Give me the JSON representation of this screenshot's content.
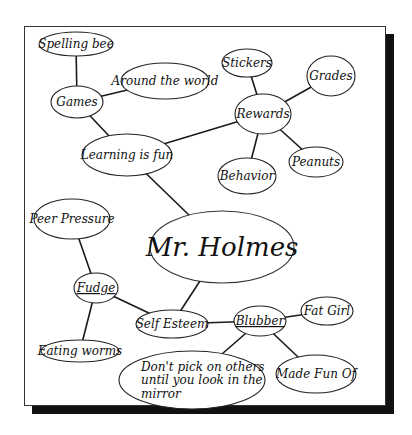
{
  "diagram": {
    "type": "concept-map",
    "center": {
      "id": "mr-holmes",
      "label": "Mr. Holmes"
    },
    "nodes": [
      {
        "id": "spelling-bee",
        "label": "Spelling bee",
        "cx": 76,
        "cy": 44,
        "rx": 37,
        "ry": 12
      },
      {
        "id": "games",
        "label": "Games",
        "cx": 77,
        "cy": 102,
        "rx": 26,
        "ry": 16
      },
      {
        "id": "around-the-world",
        "label": "Around the world",
        "cx": 165,
        "cy": 81,
        "rx": 44,
        "ry": 18
      },
      {
        "id": "learning-is-fun",
        "label": "Learning is fun",
        "cx": 127,
        "cy": 155,
        "rx": 45,
        "ry": 21
      },
      {
        "id": "stickers",
        "label": "Stickers",
        "cx": 247,
        "cy": 63,
        "rx": 25,
        "ry": 14
      },
      {
        "id": "grades",
        "label": "Grades",
        "cx": 331,
        "cy": 76,
        "rx": 24,
        "ry": 20
      },
      {
        "id": "rewards",
        "label": "Rewards",
        "cx": 263,
        "cy": 114,
        "rx": 28,
        "ry": 20
      },
      {
        "id": "behavior",
        "label": "Behavior",
        "cx": 247,
        "cy": 176,
        "rx": 29,
        "ry": 18
      },
      {
        "id": "peanuts",
        "label": "Peanuts",
        "cx": 316,
        "cy": 162,
        "rx": 27,
        "ry": 15
      },
      {
        "id": "mr-holmes",
        "label": "Mr. Holmes",
        "cx": 222,
        "cy": 247,
        "rx": 72,
        "ry": 36
      },
      {
        "id": "peer-pressure",
        "label": "Peer Pressure",
        "cx": 72,
        "cy": 219,
        "rx": 38,
        "ry": 20
      },
      {
        "id": "fudge",
        "label": "Fudge",
        "cx": 96,
        "cy": 288,
        "rx": 22,
        "ry": 15,
        "underline": true
      },
      {
        "id": "self-esteem",
        "label": "Self Esteem",
        "cx": 172,
        "cy": 324,
        "rx": 36,
        "ry": 14
      },
      {
        "id": "eating-worms",
        "label": "Eating worms",
        "cx": 80,
        "cy": 351,
        "rx": 39,
        "ry": 11
      },
      {
        "id": "blubber",
        "label": "Blubber",
        "cx": 260,
        "cy": 321,
        "rx": 26,
        "ry": 15,
        "underline": true
      },
      {
        "id": "fat-girl",
        "label": "Fat Girl",
        "cx": 327,
        "cy": 311,
        "rx": 26,
        "ry": 14
      },
      {
        "id": "dont-pick",
        "label": "Don't pick on others until you look in the mirror",
        "lines": [
          "Don't pick on others",
          "until you look in the",
          "mirror"
        ],
        "cx": 192,
        "cy": 380,
        "rx": 73,
        "ry": 29
      },
      {
        "id": "made-fun-of",
        "label": "Made Fun Of",
        "cx": 316,
        "cy": 374,
        "rx": 40,
        "ry": 19
      }
    ],
    "edges": [
      [
        "spelling-bee",
        "games"
      ],
      [
        "games",
        "around-the-world"
      ],
      [
        "games",
        "learning-is-fun"
      ],
      [
        "learning-is-fun",
        "rewards"
      ],
      [
        "learning-is-fun",
        "mr-holmes"
      ],
      [
        "rewards",
        "stickers"
      ],
      [
        "rewards",
        "grades"
      ],
      [
        "rewards",
        "behavior"
      ],
      [
        "rewards",
        "peanuts"
      ],
      [
        "mr-holmes",
        "self-esteem"
      ],
      [
        "peer-pressure",
        "fudge"
      ],
      [
        "fudge",
        "eating-worms"
      ],
      [
        "fudge",
        "self-esteem"
      ],
      [
        "self-esteem",
        "blubber"
      ],
      [
        "blubber",
        "fat-girl"
      ],
      [
        "blubber",
        "dont-pick"
      ],
      [
        "blubber",
        "made-fun-of"
      ]
    ],
    "colors": {
      "center_fill": "#e6e6e6",
      "node_fill": "#ffffff",
      "stroke": "#222222",
      "shadow": "#111111"
    }
  }
}
